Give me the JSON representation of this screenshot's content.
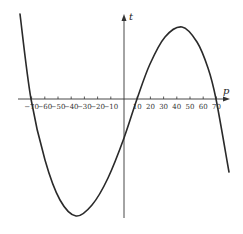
{
  "chart_data": {
    "type": "line",
    "title": "",
    "xlabel": "p",
    "ylabel": "t",
    "x_ticks": [
      -70,
      -60,
      -50,
      -40,
      -30,
      -20,
      -10,
      10,
      20,
      30,
      40,
      50,
      60,
      70
    ],
    "x_tick_labels": [
      "−70",
      "−60",
      "−50",
      "−40",
      "−30",
      "−20",
      "−10",
      "10",
      "20",
      "30",
      "40",
      "50",
      "60",
      "70"
    ],
    "xlim": [
      -80,
      80
    ],
    "grid": false,
    "legend": null,
    "series": [
      {
        "name": "t(p)",
        "roots": [
          -70,
          10,
          70
        ],
        "local_min_p": -37,
        "local_max_p": 43,
        "points_px": [
          [
            20,
            14
          ],
          [
            31,
            99
          ],
          [
            45,
            160
          ],
          [
            60,
            200
          ],
          [
            76,
            216
          ],
          [
            92,
            205
          ],
          [
            108,
            178
          ],
          [
            124,
            138
          ],
          [
            137,
            99
          ],
          [
            150,
            64
          ],
          [
            165,
            37
          ],
          [
            182,
            27
          ],
          [
            197,
            42
          ],
          [
            208,
            68
          ],
          [
            216,
            99
          ],
          [
            229,
            172
          ]
        ]
      }
    ]
  },
  "labels": {
    "x_axis": "p",
    "y_axis": "t"
  }
}
